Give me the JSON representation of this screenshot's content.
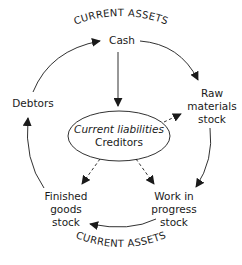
{
  "diagram": {
    "title_top": "CURRENT ASSETS",
    "title_bottom": "CURRENT ASSETS",
    "center": {
      "line1": "Current liabilities",
      "line2": "Creditors"
    },
    "nodes": {
      "cash": {
        "lines": [
          "Cash"
        ]
      },
      "raw_materials": {
        "lines": [
          "Raw",
          "materials",
          "stock"
        ]
      },
      "work_in_progress": {
        "lines": [
          "Work in",
          "progress",
          "stock"
        ]
      },
      "finished_goods": {
        "lines": [
          "Finished",
          "goods",
          "stock"
        ]
      },
      "debtors": {
        "lines": [
          "Debtors"
        ]
      }
    },
    "edges": [
      {
        "from": "Cash",
        "to": "Raw materials stock",
        "style": "solid"
      },
      {
        "from": "Raw materials stock",
        "to": "Work in progress stock",
        "style": "solid"
      },
      {
        "from": "Work in progress stock",
        "to": "Finished goods stock",
        "style": "solid"
      },
      {
        "from": "Finished goods stock",
        "to": "Debtors",
        "style": "solid"
      },
      {
        "from": "Debtors",
        "to": "Cash",
        "style": "solid"
      },
      {
        "from": "Cash",
        "to": "Current liabilities / Creditors",
        "style": "solid"
      },
      {
        "from": "Current liabilities / Creditors",
        "to": "Raw materials stock",
        "style": "dashed"
      },
      {
        "from": "Current liabilities / Creditors",
        "to": "Work in progress stock",
        "style": "dashed"
      },
      {
        "from": "Current liabilities / Creditors",
        "to": "Finished goods stock",
        "style": "dashed"
      }
    ]
  }
}
